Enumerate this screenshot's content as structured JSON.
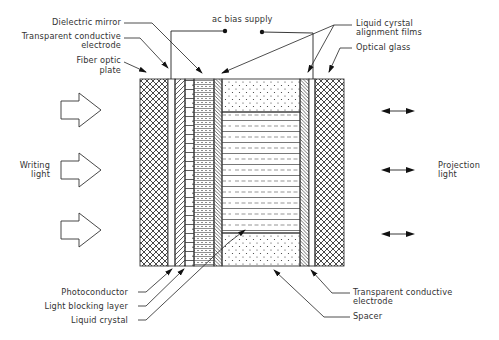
{
  "diagram": {
    "type": "cross-section"
  },
  "labels": {
    "top_left": {
      "dielectric_mirror": "Dielectric mirror",
      "transparent_electrode_l1": "Transparent conductive",
      "transparent_electrode_l2": "electrode",
      "fiber_optic_l1": "Fiber optic",
      "fiber_optic_l2": "plate"
    },
    "top_center": {
      "ac_bias": "ac bias supply"
    },
    "top_right": {
      "alignment_l1": "Liquid cyrstal",
      "alignment_l2": "alignment films",
      "optical_glass": "Optical glass"
    },
    "left": {
      "writing_l1": "Writing",
      "writing_l2": "light"
    },
    "right": {
      "projection_l1": "Projection",
      "projection_l2": "light"
    },
    "bottom_left": {
      "photoconductor": "Photoconductor",
      "light_blocking": "Light blocking layer",
      "liquid_crystal": "Liquid crystal"
    },
    "bottom_right": {
      "transparent_electrode_l1": "Transparent conductive",
      "transparent_electrode_l2": "electrode",
      "spacer": "Spacer"
    }
  },
  "layers": [
    {
      "name": "Fiber optic plate",
      "pattern": "crosshatch"
    },
    {
      "name": "Transparent conductive electrode",
      "pattern": "blank"
    },
    {
      "name": "Photoconductor",
      "pattern": "diagonal"
    },
    {
      "name": "Light blocking layer",
      "pattern": "bricks"
    },
    {
      "name": "Dielectric mirror",
      "pattern": "dense-dashes"
    },
    {
      "name": "Liquid crystal alignment film",
      "pattern": "back-diagonal"
    },
    {
      "name": "Liquid crystal / Spacer",
      "pattern": "dashes / dots"
    },
    {
      "name": "Liquid crystal alignment film",
      "pattern": "back-diagonal"
    },
    {
      "name": "Transparent conductive electrode",
      "pattern": "blank"
    },
    {
      "name": "Optical glass",
      "pattern": "crosshatch"
    }
  ],
  "arrows": {
    "writing_light": {
      "count": 3,
      "direction": "right",
      "style": "outline block arrow"
    },
    "projection_light": {
      "count": 3,
      "direction": "bidirectional",
      "style": "double-headed"
    }
  }
}
